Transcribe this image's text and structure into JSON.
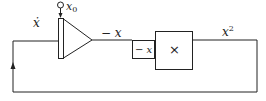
{
  "diagram": {
    "type": "analog-computer block diagram",
    "integrator": {
      "input_label": "ẋ",
      "initial_condition_label": "x",
      "initial_condition_subscript": "0",
      "output_label": "− x"
    },
    "inverter_box": {
      "label": "− x"
    },
    "multiplier": {
      "symbol": "×"
    },
    "output": {
      "label": "x",
      "superscript": "2"
    },
    "feedback": {
      "direction": "up-arrow"
    },
    "colors": {
      "line": "#222222",
      "background": "#ffffff"
    }
  }
}
